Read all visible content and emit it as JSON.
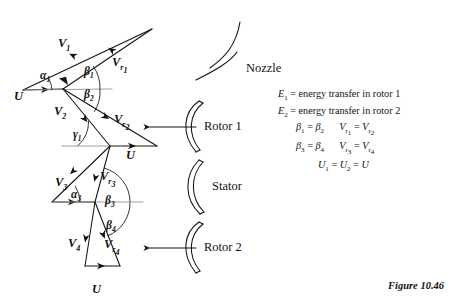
{
  "figure": {
    "caption": "Figure 10.46"
  },
  "components": [
    {
      "name": "nozzle",
      "label": "Nozzle"
    },
    {
      "name": "rotor-1",
      "label": "Rotor 1"
    },
    {
      "name": "stator",
      "label": "Stator"
    },
    {
      "name": "rotor-2",
      "label": "Rotor 2"
    }
  ],
  "vector_labels": [
    {
      "id": "V1",
      "base": "V",
      "sub": "1",
      "x": 58,
      "y": 44
    },
    {
      "id": "Vr1",
      "base": "V",
      "sub": "r1",
      "x": 110,
      "y": 58
    },
    {
      "id": "U1",
      "base": "U",
      "sub": "",
      "x": 16,
      "y": 92
    },
    {
      "id": "V2",
      "base": "V",
      "sub": "2",
      "x": 56,
      "y": 111
    },
    {
      "id": "Vr2",
      "base": "V",
      "sub": "r2",
      "x": 116,
      "y": 117
    },
    {
      "id": "U2",
      "base": "U",
      "sub": "",
      "x": 127,
      "y": 152
    },
    {
      "id": "V3",
      "base": "V",
      "sub": "3",
      "x": 58,
      "y": 182
    },
    {
      "id": "Vr3",
      "base": "V",
      "sub": "r3",
      "x": 101,
      "y": 175
    },
    {
      "id": "V4",
      "base": "V",
      "sub": "4",
      "x": 72,
      "y": 242
    },
    {
      "id": "Vr4",
      "base": "V",
      "sub": "r4",
      "x": 106,
      "y": 243
    },
    {
      "id": "U3",
      "base": "U",
      "sub": "",
      "x": 93,
      "y": 287
    }
  ],
  "angle_labels": [
    {
      "id": "alpha1",
      "glyph": "α",
      "sub": "1",
      "x": 41,
      "y": 76
    },
    {
      "id": "beta1",
      "glyph": "β",
      "sub": "1",
      "x": 86,
      "y": 73
    },
    {
      "id": "beta2",
      "glyph": "β",
      "sub": "2",
      "x": 86,
      "y": 95
    },
    {
      "id": "gamma1",
      "glyph": "γ",
      "sub": "1",
      "x": 75,
      "y": 135
    },
    {
      "id": "alpha3",
      "glyph": "α",
      "sub": "3",
      "x": 74,
      "y": 196
    },
    {
      "id": "beta3",
      "glyph": "β",
      "sub": "3",
      "x": 106,
      "y": 202
    },
    {
      "id": "beta4",
      "glyph": "β",
      "sub": "4",
      "x": 107,
      "y": 227
    }
  ],
  "equations": [
    {
      "id": "E1",
      "html": "<i>E</i><sub>1</sub> = energy transfer in rotor 1",
      "indent": 0
    },
    {
      "id": "E2",
      "html": "<i>E</i><sub>2</sub> = energy transfer in rotor 2",
      "indent": 0
    },
    {
      "id": "beta-pair-1",
      "html": "<i>&beta;</i><sub>1</sub> = <i>&beta;</i><sub>2</sub>&nbsp;&nbsp;&nbsp;&nbsp;&nbsp;&nbsp;<i>V</i><sub>r<sub>1</sub></sub> = <i>V</i><sub>r<sub>2</sub></sub>",
      "indent": 18
    },
    {
      "id": "beta-pair-2",
      "html": "<i>&beta;</i><sub>3</sub> = <i>&beta;</i><sub>4</sub>&nbsp;&nbsp;&nbsp;&nbsp;&nbsp;&nbsp;<i>V</i><sub>r<sub>3</sub></sub> = <i>V</i><sub>r<sub>4</sub></sub>",
      "indent": 18
    },
    {
      "id": "u-equality",
      "html": "<i>U</i><sub>1</sub> = <i>U</i><sub>2</sub> = <i>U</i>",
      "indent": 40
    }
  ],
  "colors": {
    "ink": "#15120f",
    "background": "#ffffff",
    "axis": "#9a958e"
  }
}
